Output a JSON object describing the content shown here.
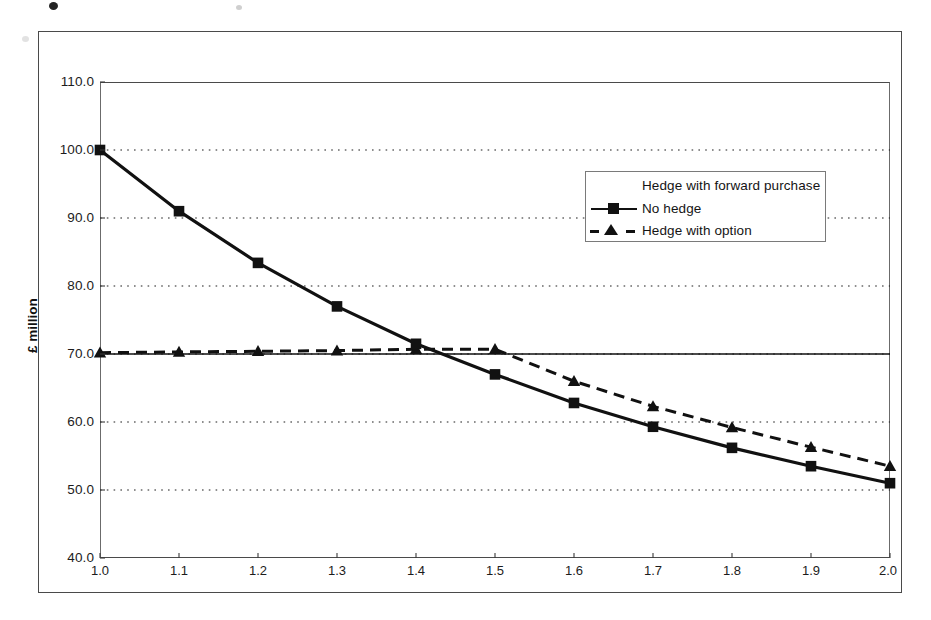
{
  "chart_data": {
    "type": "line",
    "title": "",
    "xlabel": "",
    "ylabel": "£ million",
    "xlim": [
      1.0,
      2.0
    ],
    "ylim": [
      40.0,
      110.0
    ],
    "grid": true,
    "grid_axis": "y",
    "legend_position": "upper-right-inside",
    "x": [
      1.0,
      1.1,
      1.2,
      1.3,
      1.4,
      1.5,
      1.6,
      1.7,
      1.8,
      1.9,
      2.0
    ],
    "xtick_labels": [
      "1.0",
      "1.1",
      "1.2",
      "1.3",
      "1.4",
      "1.5",
      "1.6",
      "1.7",
      "1.8",
      "1.9",
      "2.0"
    ],
    "ytick_labels": [
      "110.0",
      "100.0",
      "90.0",
      "80.0",
      "70.0",
      "60.0",
      "50.0",
      "40.0"
    ],
    "ytick_values": [
      110.0,
      100.0,
      90.0,
      80.0,
      70.0,
      60.0,
      50.0,
      40.0
    ],
    "series": [
      {
        "name": "Hedge with forward purchase",
        "marker": "none",
        "linestyle": "solid",
        "color": "#111111",
        "values": [
          70.0,
          70.0,
          70.0,
          70.0,
          70.0,
          70.0,
          70.0,
          70.0,
          70.0,
          70.0,
          70.0
        ]
      },
      {
        "name": "No hedge",
        "marker": "square",
        "linestyle": "solid",
        "color": "#111111",
        "values": [
          100.0,
          91.0,
          83.4,
          77.0,
          71.5,
          67.0,
          62.8,
          59.3,
          56.2,
          53.5,
          51.0
        ]
      },
      {
        "name": "Hedge with option",
        "marker": "triangle",
        "linestyle": "dashed",
        "color": "#111111",
        "values": [
          70.2,
          70.3,
          70.4,
          70.5,
          70.7,
          70.7,
          66.0,
          62.3,
          59.2,
          56.3,
          53.5
        ]
      }
    ]
  },
  "axes": {
    "y_title": "£ million"
  },
  "legend": {
    "entries": [
      {
        "label": "Hedge with forward purchase",
        "key": "plain-line-key"
      },
      {
        "label": "No hedge",
        "key": "square-marker-line-key"
      },
      {
        "label": "Hedge with option",
        "key": "triangle-marker-dashed-key"
      }
    ]
  }
}
